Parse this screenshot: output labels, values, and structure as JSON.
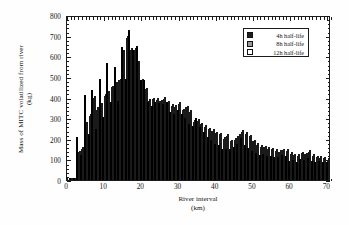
{
  "chart_data": {
    "type": "bar",
    "title": "",
    "xlabel_line1": "River interval",
    "xlabel_line2": "(km)",
    "ylabel_line1": "Mass of MITC volatilized from river",
    "ylabel_line2": "(kg)",
    "xlim": [
      0,
      71
    ],
    "ylim": [
      0,
      800
    ],
    "xticks": [
      0,
      10,
      20,
      30,
      40,
      50,
      60,
      70
    ],
    "yticks": [
      0,
      100,
      200,
      300,
      400,
      500,
      600,
      700,
      800
    ],
    "grid": false,
    "legend_position": "upper right",
    "legend": [
      "4h half-life",
      "8h half-life",
      "12h half-life"
    ],
    "colors": [
      "#1e1e1e",
      "#9a9a9a",
      "#ffffff"
    ],
    "x": [
      1,
      2,
      3,
      4,
      5,
      6,
      7,
      8,
      9,
      10,
      11,
      12,
      13,
      14,
      15,
      16,
      17,
      18,
      19,
      20,
      21,
      22,
      23,
      24,
      25,
      26,
      27,
      28,
      29,
      30,
      31,
      32,
      33,
      34,
      35,
      36,
      37,
      38,
      39,
      40,
      41,
      42,
      43,
      44,
      45,
      46,
      47,
      48,
      49,
      50,
      51,
      52,
      53,
      54,
      55,
      56,
      57,
      58,
      59,
      60,
      61,
      62,
      63,
      64,
      65,
      66,
      67,
      68,
      69,
      70
    ],
    "series": [
      {
        "name": "4h half-life",
        "values": [
          3,
          5,
          208,
          120,
          412,
          225,
          435,
          248,
          490,
          307,
          568,
          380,
          548,
          385,
          645,
          488,
          725,
          628,
          648,
          485,
          483,
          380,
          360,
          378,
          375,
          370,
          378,
          330,
          320,
          340,
          318,
          300,
          270,
          260,
          300,
          255,
          235,
          210,
          195,
          175,
          170,
          150,
          148,
          150,
          160,
          175,
          205,
          170,
          155,
          140,
          130,
          120,
          125,
          118,
          115,
          110,
          112,
          120,
          118,
          90,
          95,
          88,
          100,
          95,
          105,
          92,
          88,
          90,
          85,
          88
        ]
      },
      {
        "name": "8h half-life",
        "values": [
          5,
          8,
          135,
          150,
          275,
          310,
          400,
          340,
          368,
          408,
          425,
          450,
          468,
          485,
          622,
          690,
          632,
          632,
          570,
          485,
          440,
          385,
          392,
          390,
          382,
          395,
          378,
          360,
          355,
          370,
          338,
          352,
          330,
          282,
          288,
          270,
          258,
          245,
          238,
          228,
          222,
          200,
          215,
          188,
          195,
          215,
          235,
          225,
          212,
          188,
          170,
          160,
          158,
          150,
          148,
          140,
          138,
          145,
          142,
          128,
          122,
          118,
          130,
          125,
          138,
          118,
          112,
          108,
          105,
          98
        ]
      },
      {
        "name": "12h half-life",
        "values": [
          8,
          12,
          140,
          158,
          282,
          318,
          408,
          352,
          375,
          415,
          432,
          458,
          475,
          492,
          630,
          698,
          640,
          640,
          578,
          492,
          448,
          392,
          400,
          398,
          390,
          402,
          385,
          368,
          362,
          378,
          345,
          360,
          338,
          290,
          295,
          278,
          265,
          252,
          245,
          235,
          228,
          208,
          222,
          195,
          202,
          222,
          242,
          232,
          220,
          195,
          178,
          168,
          165,
          158,
          155,
          148,
          145,
          152,
          150,
          135,
          128,
          125,
          138,
          132,
          145,
          125,
          118,
          115,
          112,
          105
        ]
      }
    ]
  },
  "legend": {
    "items": [
      {
        "label": "4h half-life",
        "swatch": "#1e1e1e"
      },
      {
        "label": "8h half-life",
        "swatch": "#9a9a9a"
      },
      {
        "label": "12h half-life",
        "swatch": "#ffffff"
      }
    ]
  }
}
